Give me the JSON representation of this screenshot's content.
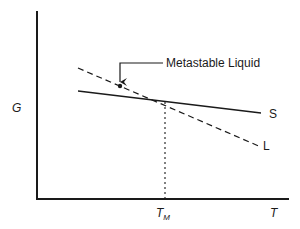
{
  "diagram": {
    "axes": {
      "y_label": "G",
      "x_label": "T",
      "x_marker_label": "T",
      "x_marker_subscript": "M"
    },
    "curves": [
      {
        "name": "S",
        "label": "S",
        "style": "solid"
      },
      {
        "name": "L",
        "label": "L",
        "style": "dashed"
      }
    ],
    "annotation": {
      "text": "Metastable Liquid"
    },
    "colors": {
      "line": "#1a1a1a",
      "background": "#ffffff"
    }
  }
}
